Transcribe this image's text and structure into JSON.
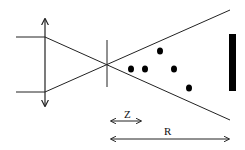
{
  "diagram": {
    "colors": {
      "line": "#222222",
      "fill": "#000000",
      "background": "#ffffff"
    },
    "lens": {
      "x": 45,
      "y_top": 17,
      "y_bottom": 108
    },
    "input_rays": [
      {
        "y": 37
      },
      {
        "y": 92
      }
    ],
    "aperture": {
      "x": 107,
      "y_top": 40,
      "y_bottom": 87
    },
    "focus_point": {
      "x": 107,
      "y": 64
    },
    "cone_end": {
      "x": 230,
      "y_top": 10,
      "y_bottom": 120
    },
    "scatterers": [
      {
        "x": 131,
        "y": 69
      },
      {
        "x": 145,
        "y": 69
      },
      {
        "x": 160,
        "y": 51
      },
      {
        "x": 174,
        "y": 69
      },
      {
        "x": 189,
        "y": 88
      }
    ],
    "detector": {
      "x": 229,
      "y": 34,
      "width": 7,
      "height": 57
    },
    "dimensions": [
      {
        "label": "Z",
        "x1": 110,
        "x2": 142,
        "y": 121,
        "label_x": 126,
        "label_y": 118
      },
      {
        "label": "R",
        "x1": 110,
        "x2": 230,
        "y": 139,
        "label_x": 166,
        "label_y": 135
      }
    ]
  }
}
